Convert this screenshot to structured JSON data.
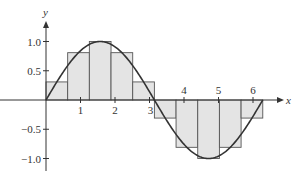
{
  "chart_data": {
    "type": "bar",
    "title": "",
    "xlabel": "x",
    "ylabel": "y",
    "xlim": [
      0,
      6.6
    ],
    "ylim": [
      -1.15,
      1.35
    ],
    "xticks": [
      1,
      2,
      3,
      4,
      5,
      6
    ],
    "xtick_labels": [
      "1",
      "2",
      "3",
      "4",
      "5",
      "6"
    ],
    "yticks": [
      1.0,
      0.5,
      -0.5,
      -1.0
    ],
    "ytick_labels": [
      "1.0",
      "0.5",
      "−0.5",
      "−1.0"
    ],
    "grid": false,
    "curve": {
      "function": "sin(x)",
      "x_start": 0,
      "x_end": 6.2832
    },
    "rectangles": {
      "width": 0.6283,
      "left_edges": [
        0,
        0.6283,
        1.2566,
        1.885,
        2.5133,
        3.1416,
        3.7699,
        4.3982,
        5.0265,
        5.6549
      ],
      "heights": [
        0.309,
        0.809,
        1.0,
        0.809,
        0.309,
        -0.309,
        -0.809,
        -1.0,
        -0.809,
        -0.309
      ]
    },
    "colors": {
      "rect_fill": "#e4e4e4",
      "rect_stroke": "#555555",
      "curve": "#333333",
      "axis": "#333333"
    }
  }
}
